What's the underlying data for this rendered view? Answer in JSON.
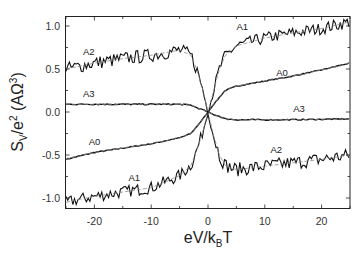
{
  "chart_data": {
    "type": "line",
    "title": "",
    "xlabel": "eV/k_BT",
    "ylabel": "S_V/e^2 (AΩ^3)",
    "xlim": [
      -25,
      25
    ],
    "ylim": [
      -1.1,
      1.1
    ],
    "xticks": [
      -20,
      -10,
      0,
      10,
      20
    ],
    "xtick_labels": [
      "-20",
      "-10",
      "0",
      "10",
      "20"
    ],
    "yticks": [
      1.0,
      0.5,
      0.0,
      -0.5,
      -1.0
    ],
    "ytick_labels": [
      "1.0",
      "0.5",
      "0.0",
      "-0.5",
      "-1.0"
    ],
    "grid": false,
    "legend": "none (curves labeled inline)",
    "x": [
      -25,
      -20,
      -15,
      -10,
      -5,
      -3,
      -2,
      -1,
      0,
      1,
      2,
      3,
      5,
      10,
      15,
      20,
      25
    ],
    "series": [
      {
        "name": "A0",
        "values": [
          -0.55,
          -0.47,
          -0.42,
          -0.37,
          -0.3,
          -0.25,
          -0.17,
          -0.09,
          0.0,
          0.09,
          0.17,
          0.25,
          0.3,
          0.36,
          0.42,
          0.49,
          0.57
        ],
        "noise": 0.005
      },
      {
        "name": "A1",
        "values": [
          -1.05,
          -0.98,
          -0.93,
          -0.88,
          -0.74,
          -0.62,
          -0.45,
          -0.25,
          0.0,
          0.25,
          0.5,
          0.65,
          0.77,
          0.86,
          0.92,
          0.97,
          1.05
        ],
        "noise": 0.07
      },
      {
        "name": "A2",
        "values": [
          0.5,
          0.57,
          0.62,
          0.66,
          0.72,
          0.66,
          0.5,
          0.28,
          0.0,
          -0.28,
          -0.5,
          -0.62,
          -0.67,
          -0.63,
          -0.59,
          -0.55,
          -0.5
        ],
        "noise": 0.08
      },
      {
        "name": "A3",
        "values": [
          0.09,
          0.09,
          0.09,
          0.09,
          0.09,
          0.08,
          0.05,
          0.03,
          0.0,
          -0.03,
          -0.05,
          -0.08,
          -0.09,
          -0.09,
          -0.09,
          -0.085,
          -0.08
        ],
        "noise": 0.006
      }
    ],
    "annotations": [
      {
        "text": "A2",
        "x": -22,
        "y": 0.66
      },
      {
        "text": "A3",
        "x": -22,
        "y": 0.17
      },
      {
        "text": "A0",
        "x": -21,
        "y": -0.38
      },
      {
        "text": "A1",
        "x": -14,
        "y": -0.8
      },
      {
        "text": "A1",
        "x": 5,
        "y": 0.95
      },
      {
        "text": "A0",
        "x": 12,
        "y": 0.42
      },
      {
        "text": "A3",
        "x": 15,
        "y": 0.0
      },
      {
        "text": "A2",
        "x": 11,
        "y": -0.48
      }
    ],
    "fit_lines": "dashed gray fits overlay each curve"
  },
  "axes": {
    "xlabel_main": "eV/k",
    "xlabel_sub": "B",
    "xlabel_tail": "T",
    "ylabel_main": "S",
    "ylabel_sub": "V",
    "ylabel_mid": "/e",
    "ylabel_sup": "2",
    "ylabel_tail": " (AΩ",
    "ylabel_sup2": "3",
    "ylabel_close": ")"
  },
  "colors": {
    "line": "#111111",
    "fit": "#888888",
    "axis": "#222222"
  }
}
